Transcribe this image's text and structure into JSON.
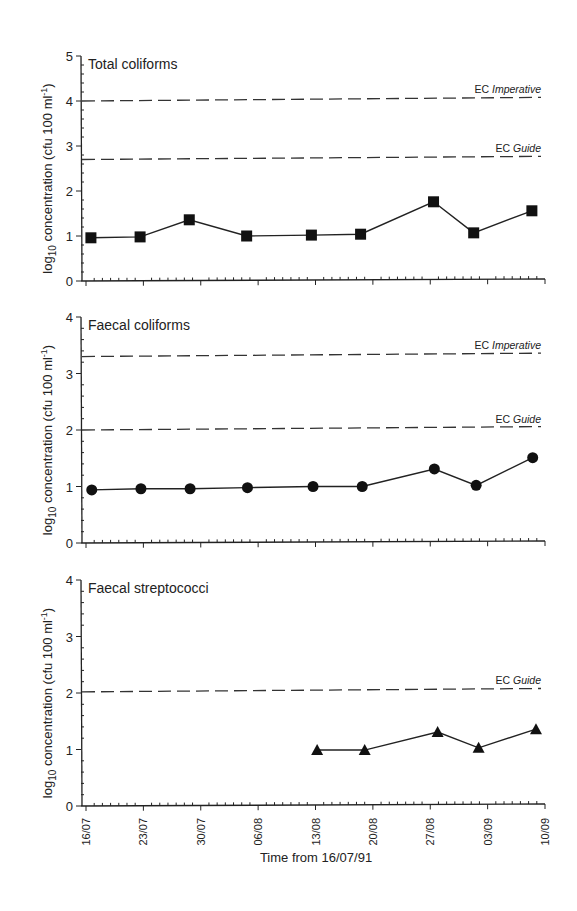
{
  "chart_data": [
    {
      "type": "line",
      "title": "Total coliforms",
      "ylabel": "log10 concentration (cfu 100 ml-1)",
      "ylim": [
        0,
        5
      ],
      "yticks": [
        0,
        1,
        2,
        3,
        4,
        5
      ],
      "marker": "square",
      "reference_lines": [
        {
          "label_prefix": "EC",
          "label_italic": "Imperative",
          "y": 4.0,
          "y_end": 4.08
        },
        {
          "label_prefix": "EC",
          "label_italic": "Guide",
          "y": 2.7,
          "y_end": 2.77
        }
      ],
      "x_days": [
        0.6,
        6.6,
        12.6,
        19.6,
        27.5,
        33.5,
        42.4,
        47.3,
        54.4
      ],
      "values": [
        0.96,
        0.98,
        1.36,
        1.0,
        1.02,
        1.04,
        1.76,
        1.07,
        1.56
      ]
    },
    {
      "type": "line",
      "title": "Faecal coliforms",
      "ylabel": "log10 concentration (cfu 100 ml-1)",
      "ylim": [
        0,
        4
      ],
      "yticks": [
        0,
        1,
        2,
        3,
        4
      ],
      "marker": "circle",
      "reference_lines": [
        {
          "label_prefix": "EC",
          "label_italic": "Imperative",
          "y": 3.3,
          "y_end": 3.36
        },
        {
          "label_prefix": "EC",
          "label_italic": "Guide",
          "y": 2.0,
          "y_end": 2.06
        }
      ],
      "x_days": [
        0.7,
        6.7,
        12.7,
        19.7,
        27.7,
        33.7,
        42.5,
        47.6,
        54.5
      ],
      "values": [
        0.94,
        0.96,
        0.96,
        0.98,
        1.0,
        1.0,
        1.31,
        1.02,
        1.51
      ]
    },
    {
      "type": "line",
      "title": "Faecal streptococci",
      "ylabel": "log10 concentration (cfu 100 ml-1)",
      "ylim": [
        0,
        4
      ],
      "yticks": [
        0,
        1,
        2,
        3,
        4
      ],
      "marker": "triangle",
      "reference_lines": [
        {
          "label_prefix": "EC",
          "label_italic": "Guide",
          "y": 2.02,
          "y_end": 2.08
        }
      ],
      "x_days": [
        28.2,
        34.0,
        42.9,
        47.9,
        54.9
      ],
      "values": [
        0.99,
        0.99,
        1.31,
        1.03,
        1.36
      ]
    }
  ],
  "x_axis": {
    "title": "Time from 16/07/91",
    "tick_labels": [
      "16/07",
      "23/07",
      "30/07",
      "06/08",
      "13/08",
      "20/08",
      "27/08",
      "03/09",
      "10/09"
    ],
    "tick_days": [
      0,
      7,
      14,
      21,
      28,
      35,
      42,
      49,
      56
    ],
    "range_days": [
      0,
      56
    ]
  },
  "ylabel_parts": {
    "pre": "log",
    "sub": "10",
    "mid": " concentration (cfu 100 ml",
    "sup": "-1",
    "post": ")"
  }
}
